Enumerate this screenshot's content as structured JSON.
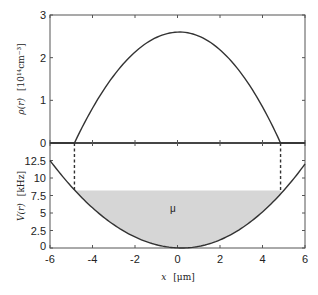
{
  "chart_data": [
    {
      "type": "line",
      "panel": "top",
      "title": "",
      "xlabel": "",
      "ylabel": "ρ(r) [10^14 cm^-3]",
      "xlim": [
        -6,
        6
      ],
      "ylim": [
        0,
        3
      ],
      "xticks": [
        -6,
        -4,
        -2,
        0,
        2,
        4,
        6
      ],
      "yticks": [
        0,
        1,
        2,
        3
      ],
      "ytick_labels": [
        "0",
        "1",
        "2",
        "3"
      ],
      "grid": false,
      "series": [
        {
          "name": "density",
          "x": [
            -6,
            -5,
            -4.9,
            -4,
            -3,
            -2,
            -1,
            0,
            0.2,
            1,
            2,
            3,
            4,
            4.9,
            5,
            6
          ],
          "values": [
            0,
            0,
            0,
            0.87,
            1.6,
            2.1,
            2.45,
            2.6,
            2.6,
            2.52,
            2.3,
            1.82,
            1.12,
            0,
            0,
            0
          ]
        }
      ],
      "annotations": []
    },
    {
      "type": "area",
      "panel": "bottom",
      "title": "",
      "xlabel": "x [μm]",
      "ylabel": "V(r) [kHz]",
      "xlim": [
        -6,
        6
      ],
      "ylim": [
        0,
        15
      ],
      "xticks": [
        -6,
        -4,
        -2,
        0,
        2,
        4,
        6
      ],
      "xtick_labels": [
        "-6",
        "-4",
        "-2",
        "0",
        "2",
        "4",
        "6"
      ],
      "yticks": [
        0,
        2.5,
        5,
        7.5,
        10,
        12.5
      ],
      "ytick_labels": [
        "0",
        "2.5",
        "5",
        "7.5",
        "10",
        "12.5"
      ],
      "grid": false,
      "series": [
        {
          "name": "potential",
          "x": [
            -6,
            -5,
            -4.85,
            -4,
            -3,
            -2,
            -1,
            0,
            0.2,
            1,
            2,
            3,
            4,
            4.85,
            5,
            6
          ],
          "values": [
            12.5,
            8.8,
            8.2,
            5.6,
            3.3,
            1.6,
            0.5,
            0.05,
            0,
            0.3,
            1.2,
            2.8,
            5.0,
            8.2,
            8.6,
            12.0
          ]
        },
        {
          "name": "chemical potential μ (shaded fill)",
          "x": [
            -4.85,
            4.85
          ],
          "values": [
            8.2,
            8.2
          ]
        }
      ],
      "annotations": [
        {
          "text": "μ",
          "x": 0,
          "y": 6.5
        },
        {
          "text": "dashed vertical line",
          "x": -4.85
        },
        {
          "text": "dashed vertical line",
          "x": 4.85
        }
      ]
    }
  ],
  "labels": {
    "top_ylabel_main": "ρ(r)",
    "top_ylabel_unit": "[10¹⁴cm⁻³]",
    "bottom_ylabel_main": "V(r)",
    "bottom_ylabel_unit": "[kHz]",
    "xlabel_main": "x",
    "xlabel_unit": "[μm]",
    "mu": "μ",
    "top_yticks": [
      "0",
      "1",
      "2",
      "3"
    ],
    "bottom_yticks": [
      "0",
      "2.5",
      "5",
      "7.5",
      "10",
      "12.5"
    ],
    "xticks": [
      "-6",
      "-4",
      "-2",
      "0",
      "2",
      "4",
      "6"
    ]
  },
  "colors": {
    "line": "#333333",
    "fill": "#d6d6d6",
    "frame": "#555555"
  }
}
